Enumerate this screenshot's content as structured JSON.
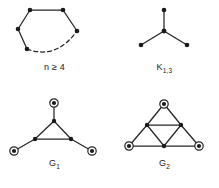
{
  "figure": {
    "background_color": "#ffffff",
    "ink_color": "#262626",
    "panels": [
      {
        "id": "cycle",
        "caption": "n ≥ 4",
        "caption_text_plain": "n >= 4",
        "description": "cycle graph with solid edges and one dashed arc",
        "vertex_style": "filled-dot",
        "vertices": [
          {
            "name": "top-left",
            "x": 30,
            "y": 10
          },
          {
            "name": "top-right",
            "x": 63,
            "y": 10
          },
          {
            "name": "left",
            "x": 18,
            "y": 29
          },
          {
            "name": "right",
            "x": 77,
            "y": 31
          },
          {
            "name": "bottom-left",
            "x": 27,
            "y": 49
          }
        ],
        "solid_edges": [
          [
            "top-left",
            "top-right"
          ],
          [
            "top-left",
            "left"
          ],
          [
            "top-right",
            "right"
          ],
          [
            "left",
            "bottom-left"
          ]
        ],
        "dashed_edges": [
          [
            "bottom-left",
            "right"
          ]
        ]
      },
      {
        "id": "k13",
        "caption": "K",
        "caption_subscript": "1,3",
        "description": "star graph K 1,3 with a center vertex and three leaves",
        "vertex_style": "filled-dot",
        "vertices": [
          {
            "name": "center",
            "x": 54,
            "y": 31
          },
          {
            "name": "leaf-top",
            "x": 54,
            "y": 10
          },
          {
            "name": "leaf-left",
            "x": 31,
            "y": 45
          },
          {
            "name": "leaf-right",
            "x": 77,
            "y": 45
          }
        ],
        "solid_edges": [
          [
            "center",
            "leaf-top"
          ],
          [
            "center",
            "leaf-left"
          ],
          [
            "center",
            "leaf-right"
          ]
        ],
        "dashed_edges": []
      },
      {
        "id": "g1",
        "caption": "G",
        "caption_subscript": "1",
        "description": "triangle with a pendant circled vertex attached to each triangle vertex",
        "vertices": [
          {
            "name": "tri-top",
            "x": 54,
            "y": 27,
            "style": "filled-dot"
          },
          {
            "name": "tri-left",
            "x": 35,
            "y": 45,
            "style": "filled-dot"
          },
          {
            "name": "tri-right",
            "x": 71,
            "y": 45,
            "style": "filled-dot"
          },
          {
            "name": "pend-top",
            "x": 54,
            "y": 9,
            "style": "circled-dot"
          },
          {
            "name": "pend-left",
            "x": 14,
            "y": 57,
            "style": "circled-dot"
          },
          {
            "name": "pend-right",
            "x": 92,
            "y": 57,
            "style": "circled-dot"
          }
        ],
        "solid_edges": [
          [
            "tri-top",
            "tri-left"
          ],
          [
            "tri-left",
            "tri-right"
          ],
          [
            "tri-right",
            "tri-top"
          ],
          [
            "tri-top",
            "pend-top"
          ],
          [
            "tri-left",
            "pend-left"
          ],
          [
            "tri-right",
            "pend-right"
          ]
        ],
        "dashed_edges": []
      },
      {
        "id": "g2",
        "caption": "G",
        "caption_subscript": "2",
        "description": "triangle subdivided by its three midpoints into four triangles; corner vertices are circled",
        "vertices": [
          {
            "name": "corner-top",
            "x": 54,
            "y": 10,
            "style": "circled-dot"
          },
          {
            "name": "corner-left",
            "x": 19,
            "y": 52,
            "style": "circled-dot"
          },
          {
            "name": "corner-right",
            "x": 89,
            "y": 52,
            "style": "circled-dot"
          },
          {
            "name": "mid-left",
            "x": 37,
            "y": 31,
            "style": "filled-dot"
          },
          {
            "name": "mid-right",
            "x": 71,
            "y": 31,
            "style": "filled-dot"
          },
          {
            "name": "mid-bottom",
            "x": 54,
            "y": 52,
            "style": "filled-dot"
          }
        ],
        "solid_edges": [
          [
            "corner-top",
            "mid-left"
          ],
          [
            "corner-top",
            "mid-right"
          ],
          [
            "mid-left",
            "mid-right"
          ],
          [
            "mid-left",
            "corner-left"
          ],
          [
            "mid-left",
            "mid-bottom"
          ],
          [
            "mid-right",
            "mid-bottom"
          ],
          [
            "mid-right",
            "corner-right"
          ],
          [
            "corner-left",
            "mid-bottom"
          ],
          [
            "mid-bottom",
            "corner-right"
          ]
        ],
        "dashed_edges": []
      }
    ]
  }
}
